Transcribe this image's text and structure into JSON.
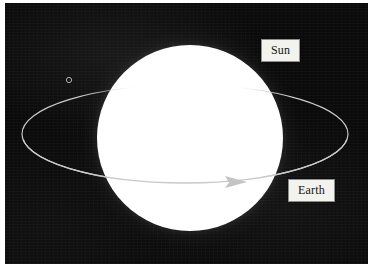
{
  "figure": {
    "kind": "astronomy-photograph-diagram",
    "background_color": "#0a0a0a",
    "page_color": "#ffffff"
  },
  "plate": {
    "name": "photographic-plate",
    "left": 5,
    "top": 3,
    "width": 363,
    "height": 261
  },
  "sun": {
    "name": "sun-disc",
    "center_x": 185,
    "center_y": 135,
    "core_radius": 93,
    "glow_radius": 140,
    "color": "#ffffff"
  },
  "orbit": {
    "name": "earth-orbit-ellipse",
    "center_x": 185,
    "center_y": 134,
    "radius_x": 163,
    "radius_y": 49,
    "stroke_color": "#cfcfcf",
    "stroke_width": 1.1,
    "direction": "counterclockwise-as-drawn-left-to-right-in-front",
    "arrow": {
      "label": "orbital-direction-arrow",
      "tip_x": 247,
      "tip_y": 182,
      "color": "#bdbdbd"
    }
  },
  "earth_marker": {
    "name": "earth-position-marker",
    "x": 69,
    "y": 80,
    "radius": 2.6,
    "stroke_color": "#b9b9b9"
  },
  "callouts": [
    {
      "id": "sun",
      "label": "Sun",
      "x": 261,
      "y": 39,
      "box_color": "#f2f2ef",
      "border_color": "#8e8e8e",
      "text_color": "#141414"
    },
    {
      "id": "earth",
      "label": "Earth",
      "x": 288,
      "y": 179,
      "box_color": "#f2f2ef",
      "border_color": "#8e8e8e",
      "text_color": "#141414"
    }
  ]
}
